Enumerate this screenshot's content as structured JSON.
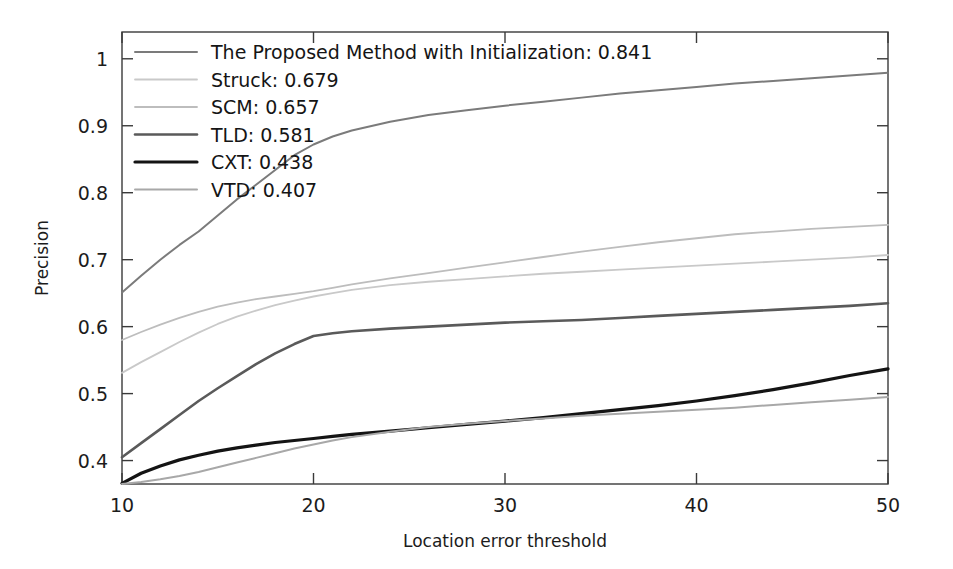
{
  "chart_data": {
    "type": "line",
    "title": "",
    "xlabel": "Location error threshold",
    "ylabel": "Precision",
    "xlim": [
      10,
      50
    ],
    "ylim": [
      0.365,
      1.04
    ],
    "grid": false,
    "legend_position": "top-left",
    "xticks": [
      10,
      20,
      30,
      40,
      50
    ],
    "xtick_labels": [
      "10",
      "20",
      "30",
      "40",
      "50"
    ],
    "yticks": [
      0.4,
      0.5,
      0.6,
      0.7,
      0.8,
      0.9,
      1.0
    ],
    "ytick_labels": [
      "0.4",
      "0.5",
      "0.6",
      "0.7",
      "0.8",
      "0.9",
      "1"
    ],
    "x": [
      10,
      11,
      12,
      13,
      14,
      15,
      16,
      17,
      18,
      19,
      20,
      21,
      22,
      24,
      26,
      28,
      30,
      32,
      34,
      36,
      38,
      40,
      42,
      44,
      46,
      48,
      50
    ],
    "series": [
      {
        "name": "The Proposed Method with Initialization",
        "score": "0.841",
        "color": "#7b7b7b",
        "width": 2.0,
        "values": [
          0.651,
          0.676,
          0.7,
          0.722,
          0.742,
          0.766,
          0.79,
          0.812,
          0.834,
          0.856,
          0.872,
          0.884,
          0.893,
          0.906,
          0.916,
          0.923,
          0.93,
          0.936,
          0.942,
          0.948,
          0.953,
          0.958,
          0.963,
          0.967,
          0.971,
          0.975,
          0.979
        ]
      },
      {
        "name": "Struck",
        "score": "0.679",
        "color": "#c9c9c9",
        "width": 1.8,
        "values": [
          0.531,
          0.547,
          0.562,
          0.577,
          0.591,
          0.604,
          0.615,
          0.624,
          0.632,
          0.639,
          0.645,
          0.65,
          0.655,
          0.662,
          0.667,
          0.671,
          0.675,
          0.679,
          0.682,
          0.685,
          0.688,
          0.691,
          0.694,
          0.697,
          0.7,
          0.703,
          0.707
        ]
      },
      {
        "name": "SCM",
        "score": "0.657",
        "color": "#bdbdbd",
        "width": 1.8,
        "values": [
          0.58,
          0.592,
          0.603,
          0.613,
          0.622,
          0.63,
          0.636,
          0.641,
          0.645,
          0.649,
          0.653,
          0.658,
          0.663,
          0.672,
          0.68,
          0.688,
          0.696,
          0.704,
          0.712,
          0.719,
          0.726,
          0.732,
          0.738,
          0.742,
          0.746,
          0.749,
          0.752
        ]
      },
      {
        "name": "TLD",
        "score": "0.581",
        "color": "#5a5a5a",
        "width": 2.6,
        "values": [
          0.405,
          0.426,
          0.447,
          0.468,
          0.489,
          0.508,
          0.526,
          0.544,
          0.56,
          0.574,
          0.586,
          0.59,
          0.593,
          0.597,
          0.6,
          0.603,
          0.606,
          0.608,
          0.61,
          0.613,
          0.616,
          0.619,
          0.622,
          0.625,
          0.628,
          0.631,
          0.635
        ]
      },
      {
        "name": "CXT",
        "score": "0.438",
        "color": "#141414",
        "width": 3.2,
        "values": [
          0.366,
          0.381,
          0.392,
          0.401,
          0.408,
          0.414,
          0.419,
          0.423,
          0.427,
          0.43,
          0.433,
          0.436,
          0.439,
          0.444,
          0.449,
          0.454,
          0.459,
          0.464,
          0.47,
          0.476,
          0.482,
          0.489,
          0.497,
          0.506,
          0.516,
          0.527,
          0.537
        ]
      },
      {
        "name": "VTD",
        "score": "0.407",
        "color": "#a8a8a8",
        "width": 2.0,
        "values": [
          0.365,
          0.368,
          0.372,
          0.377,
          0.383,
          0.39,
          0.397,
          0.404,
          0.411,
          0.418,
          0.424,
          0.43,
          0.435,
          0.443,
          0.45,
          0.455,
          0.459,
          0.463,
          0.467,
          0.47,
          0.473,
          0.476,
          0.479,
          0.483,
          0.487,
          0.491,
          0.495
        ]
      }
    ],
    "legend_entries": [
      "The Proposed Method with Initialization: 0.841",
      "Struck: 0.679",
      "SCM: 0.657",
      "TLD: 0.581",
      "CXT: 0.438",
      "VTD: 0.407"
    ]
  }
}
